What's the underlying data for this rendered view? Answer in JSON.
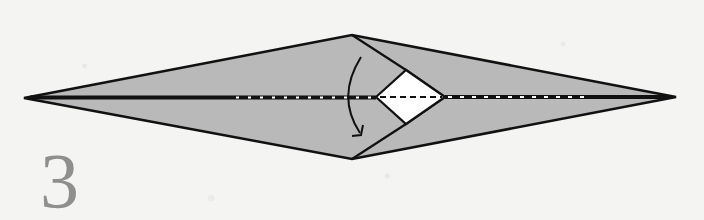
{
  "step": {
    "number": "3"
  },
  "colors": {
    "background": "#f4f4f3",
    "paper_fill": "#b9b9b9",
    "inner_flap": "#ffffff",
    "stroke": "#111111",
    "step_number": "#8f8f8f"
  },
  "diagram": {
    "outline": [
      [
        24,
        98
      ],
      [
        352,
        35
      ],
      [
        676,
        97
      ],
      [
        352,
        159
      ]
    ],
    "diamond": [
      [
        376,
        97
      ],
      [
        406,
        70
      ],
      [
        445,
        97
      ],
      [
        406,
        124
      ]
    ],
    "arrow": {
      "direction": "down",
      "meaning": "fold top flap down"
    },
    "fold_lines": {
      "center": "mountain-fold (black with white dots) outside diamond, dashed valley fold inside diamond"
    }
  }
}
